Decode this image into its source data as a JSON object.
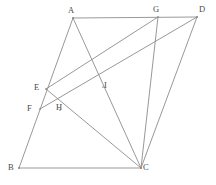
{
  "figure": {
    "stroke_color": "#8c8c8c",
    "label_color": "#4a4a4a",
    "background_color": "#ffffff",
    "width": 216,
    "height": 185
  },
  "points": [
    {
      "id": "A",
      "label": "A",
      "x": 73,
      "y": 18,
      "label_x": 68,
      "label_y": 6,
      "kind": "vertex"
    },
    {
      "id": "G",
      "label": "G",
      "x": 158,
      "y": 17,
      "label_x": 153,
      "label_y": 5,
      "kind": "point-on-side"
    },
    {
      "id": "D",
      "label": "D",
      "x": 197,
      "y": 17,
      "label_x": 199,
      "label_y": 5,
      "kind": "vertex"
    },
    {
      "id": "E",
      "label": "E",
      "x": 46,
      "y": 89,
      "label_x": 34,
      "label_y": 83,
      "kind": "point-on-side"
    },
    {
      "id": "I",
      "label": "I",
      "x": 103,
      "y": 87,
      "label_x": 104,
      "label_y": 81,
      "kind": "intersection"
    },
    {
      "id": "F",
      "label": "F",
      "x": 40,
      "y": 109,
      "label_x": 27,
      "label_y": 104,
      "kind": "point-on-side"
    },
    {
      "id": "H",
      "label": "H",
      "x": 60,
      "y": 110,
      "label_x": 56,
      "label_y": 103,
      "kind": "intersection"
    },
    {
      "id": "B",
      "label": "B",
      "x": 19,
      "y": 168,
      "label_x": 8,
      "label_y": 163,
      "kind": "vertex"
    },
    {
      "id": "C",
      "label": "C",
      "x": 141,
      "y": 168,
      "label_x": 143,
      "label_y": 163,
      "kind": "vertex"
    }
  ],
  "segments": [
    {
      "id": "AD",
      "from": "A",
      "to": "D",
      "name": "segment-AD",
      "emphasis": "strong"
    },
    {
      "id": "BC",
      "from": "B",
      "to": "C",
      "name": "segment-BC",
      "emphasis": "strong"
    },
    {
      "id": "AB",
      "from": "A",
      "to": "B",
      "name": "segment-AB",
      "emphasis": "normal"
    },
    {
      "id": "DC",
      "from": "D",
      "to": "C",
      "name": "segment-DC",
      "emphasis": "normal"
    },
    {
      "id": "AC",
      "from": "A",
      "to": "C",
      "name": "diagonal-AC",
      "emphasis": "normal"
    },
    {
      "id": "EG",
      "from": "E",
      "to": "G",
      "name": "segment-EG",
      "emphasis": "normal"
    },
    {
      "id": "FD",
      "from": "F",
      "to": "D",
      "name": "segment-FD",
      "emphasis": "normal"
    },
    {
      "id": "EC",
      "from": "E",
      "to": "C",
      "name": "segment-EC",
      "emphasis": "normal"
    },
    {
      "id": "GC",
      "from": "G",
      "to": "C",
      "name": "segment-GC",
      "emphasis": "normal"
    }
  ],
  "labels": {
    "A": "A",
    "B": "B",
    "C": "C",
    "D": "D",
    "E": "E",
    "F": "F",
    "G": "G",
    "H": "H",
    "I": "I"
  }
}
